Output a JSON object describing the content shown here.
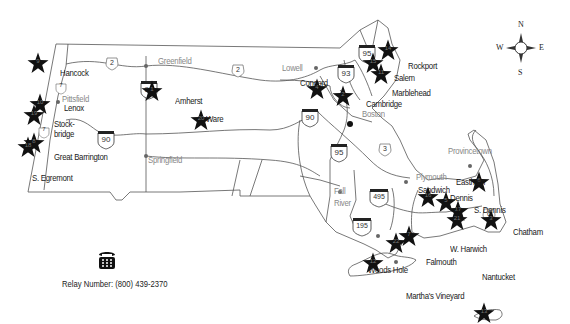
{
  "map": {
    "title": "Massachusetts locations map",
    "compass": {
      "n": "N",
      "s": "S",
      "e": "E",
      "w": "W"
    },
    "relay": {
      "label": "Relay Number: (800) 439-2370",
      "icon": "telephone-icon"
    },
    "locations": [
      {
        "num": "1",
        "name": "Amherst",
        "x": 152,
        "y": 91
      },
      {
        "num": "2",
        "name": "Cambridge",
        "x": 343,
        "y": 96
      },
      {
        "num": "3",
        "name": "Chatham",
        "x": 491,
        "y": 220
      },
      {
        "num": "4",
        "name": "Concord",
        "x": 317,
        "y": 89
      },
      {
        "num": "5",
        "name": "Dennis",
        "x": 446,
        "y": 202
      },
      {
        "num": "6",
        "name": "Eastham",
        "x": 479,
        "y": 182
      },
      {
        "num": "7",
        "name": "Falmouth",
        "x": 409,
        "y": 236
      },
      {
        "num": "8",
        "name": "Great Barrington",
        "x": 34,
        "y": 143
      },
      {
        "num": "9",
        "name": "Hancock",
        "x": 38,
        "y": 63
      },
      {
        "num": "10",
        "name": "Lenox",
        "x": 40,
        "y": 104
      },
      {
        "num": "11",
        "name": "Marblehead",
        "x": 381,
        "y": 74
      },
      {
        "num": "12",
        "name": "Martha's Vineyard",
        "x": 373,
        "y": 263
      },
      {
        "num": "13",
        "name": "Nantucket",
        "x": 484,
        "y": 313
      },
      {
        "num": "14",
        "name": "Rockport",
        "x": 388,
        "y": 50
      },
      {
        "num": "15",
        "name": "Salem",
        "x": 373,
        "y": 63
      },
      {
        "num": "16",
        "name": "Sandwich",
        "x": 428,
        "y": 197
      },
      {
        "num": "17",
        "name": "S. Dennis",
        "x": 458,
        "y": 211
      },
      {
        "num": "18",
        "name": "S. Egremont",
        "x": 28,
        "y": 147
      },
      {
        "num": "19",
        "name": "Stockbridge",
        "x": 34,
        "y": 115
      },
      {
        "num": "20",
        "name": "Ware",
        "x": 201,
        "y": 120
      },
      {
        "num": "21",
        "name": "W. Harwich",
        "x": 457,
        "y": 220
      },
      {
        "num": "22",
        "name": "Woods Hole",
        "x": 396,
        "y": 243
      }
    ],
    "labels": {
      "hancock": "Hancock",
      "pittsfield": "Pittsfield",
      "lenox": "Lenox",
      "stockbridge1": "Stock-",
      "stockbridge2": "bridge",
      "great_barrington": "Great Barrington",
      "s_egremont": "S. Egremont",
      "greenfield": "Greenfield",
      "springfield": "Springfield",
      "amherst": "Amherst",
      "ware": "Ware",
      "lowell": "Lowell",
      "concord": "Concord",
      "cambridge": "Cambridge",
      "boston": "Boston",
      "rockport": "Rockport",
      "salem": "Salem",
      "marblehead": "Marblehead",
      "provincetown": "Provincetown",
      "plymouth": "Plymouth",
      "sandwich": "Sandwich",
      "dennis": "Dennis",
      "s_dennis": "S. Dennis",
      "eastham": "Eastham",
      "chatham": "Chatham",
      "w_harwich": "W. Harwich",
      "falmouth": "Falmouth",
      "woods_hole": "Woods Hole",
      "marthas_vineyard": "Martha's Vineyard",
      "nantucket": "Nantucket",
      "fall": "Fall",
      "river": "River"
    },
    "routes": {
      "i91": "91",
      "i90a": "90",
      "i90b": "90",
      "i93": "93",
      "i95a": "95",
      "i95b": "95",
      "i495": "495",
      "i195": "195",
      "r2a": "2",
      "r2b": "2",
      "r3": "3",
      "r6": "6",
      "r7a": "7",
      "r7b": "7"
    }
  }
}
